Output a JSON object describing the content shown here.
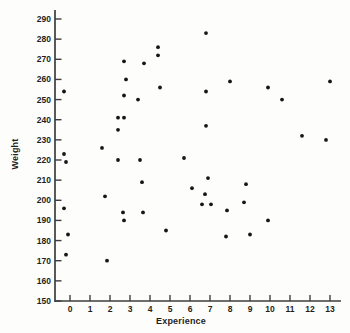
{
  "figure": {
    "background": "#fdfdfb"
  },
  "chart_data": {
    "type": "scatter",
    "title": "",
    "xlabel": "Experience",
    "ylabel": "Weight",
    "xlim": [
      -0.75,
      13.6
    ],
    "ylim": [
      150,
      295
    ],
    "x_ticks": [
      0,
      1,
      2,
      3,
      4,
      5,
      6,
      7,
      8,
      9,
      10,
      11,
      12,
      13
    ],
    "y_ticks": [
      150,
      160,
      170,
      180,
      190,
      200,
      210,
      220,
      230,
      240,
      250,
      260,
      270,
      280,
      290
    ],
    "grid": false,
    "legend": null,
    "points_format": [
      "experience",
      "weight"
    ],
    "points": [
      [
        -0.3,
        254
      ],
      [
        -0.3,
        223
      ],
      [
        -0.2,
        219
      ],
      [
        -0.3,
        196
      ],
      [
        -0.1,
        183
      ],
      [
        -0.2,
        173
      ],
      [
        1.6,
        226
      ],
      [
        1.75,
        202
      ],
      [
        1.85,
        170
      ],
      [
        2.7,
        269
      ],
      [
        2.8,
        260
      ],
      [
        2.7,
        252
      ],
      [
        2.4,
        241
      ],
      [
        2.7,
        241
      ],
      [
        2.4,
        235
      ],
      [
        2.4,
        220
      ],
      [
        2.65,
        194
      ],
      [
        2.7,
        190
      ],
      [
        3.7,
        268
      ],
      [
        3.4,
        250
      ],
      [
        3.5,
        220
      ],
      [
        3.6,
        209
      ],
      [
        3.65,
        194
      ],
      [
        4.4,
        276
      ],
      [
        4.4,
        272
      ],
      [
        4.5,
        256
      ],
      [
        4.8,
        185
      ],
      [
        5.7,
        221
      ],
      [
        6.8,
        283
      ],
      [
        6.8,
        254
      ],
      [
        6.8,
        237
      ],
      [
        6.9,
        211
      ],
      [
        6.1,
        206
      ],
      [
        6.75,
        203
      ],
      [
        6.6,
        198
      ],
      [
        7.05,
        198
      ],
      [
        8.0,
        259
      ],
      [
        7.85,
        195
      ],
      [
        7.8,
        182
      ],
      [
        8.8,
        208
      ],
      [
        8.7,
        199
      ],
      [
        9.0,
        183
      ],
      [
        9.9,
        256
      ],
      [
        9.9,
        190
      ],
      [
        10.6,
        250
      ],
      [
        11.6,
        232
      ],
      [
        12.8,
        230
      ],
      [
        13.0,
        259
      ]
    ],
    "dot_color": "#161616",
    "axis_color": "#3d3d3d",
    "text_color": "#1f1f1f"
  }
}
